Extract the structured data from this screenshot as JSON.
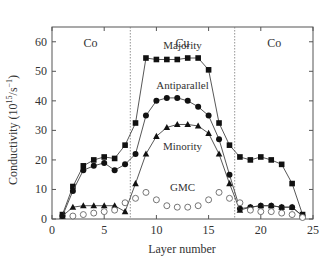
{
  "chart_data": {
    "type": "line",
    "title": "",
    "xlabel": "Layer number",
    "ylabel": "Conductivity (10^15 /s^-1)",
    "ylabel_parts": {
      "main": "Conductivity (10",
      "sup1": "15",
      "mid": "/s",
      "sup2": "−1",
      "end": ")"
    },
    "xlim": [
      0,
      25
    ],
    "ylim": [
      0,
      65
    ],
    "xticks": [
      0,
      5,
      10,
      15,
      20,
      25
    ],
    "yticks": [
      0,
      10,
      20,
      30,
      40,
      50,
      60
    ],
    "grid": false,
    "legend_position": "inline labels",
    "region_boundaries": [
      7.5,
      17.5
    ],
    "regions": [
      {
        "label": "Co",
        "x": 3.7
      },
      {
        "label": "Cu",
        "x": 12.5
      },
      {
        "label": "Co",
        "x": 21.3
      }
    ],
    "series": [
      {
        "name": "Majority",
        "marker": "filled-square",
        "line": true,
        "label_pos": [
          12.5,
          57.5
        ],
        "x": [
          1,
          2,
          3,
          4,
          5,
          6,
          7,
          8,
          9,
          10,
          11,
          12,
          13,
          14,
          15,
          16,
          17,
          18,
          19,
          20,
          21,
          22,
          23,
          24
        ],
        "values": [
          1.5,
          11,
          18,
          20,
          21,
          20.5,
          25,
          32.5,
          54.5,
          54,
          54,
          54,
          54.5,
          54.5,
          50.5,
          32.5,
          25,
          21,
          20,
          21,
          20,
          18.5,
          12,
          1.5
        ]
      },
      {
        "name": "Antiparallel",
        "marker": "filled-circle",
        "line": true,
        "label_pos": [
          12.5,
          44
        ],
        "x": [
          1,
          2,
          3,
          4,
          5,
          6,
          7,
          8,
          9,
          10,
          11,
          12,
          13,
          14,
          15,
          16,
          17,
          18,
          19,
          20,
          21,
          22,
          23,
          24
        ],
        "values": [
          1,
          9.5,
          16.5,
          18,
          19,
          16.5,
          18.5,
          22,
          35,
          40,
          41,
          41,
          40,
          38,
          35,
          27,
          15,
          3.5,
          4,
          4.5,
          4.5,
          4,
          4,
          1
        ]
      },
      {
        "name": "Minority",
        "marker": "filled-triangle",
        "line": true,
        "label_pos": [
          12.5,
          23.5
        ],
        "x": [
          1,
          2,
          3,
          4,
          5,
          6,
          7,
          8,
          9,
          10,
          11,
          12,
          13,
          14,
          15,
          16,
          17,
          18,
          19,
          20,
          21,
          22,
          23,
          24
        ],
        "values": [
          1,
          4,
          4.5,
          4.5,
          4.5,
          4.5,
          2.5,
          12,
          22,
          28,
          31,
          32,
          32,
          31.5,
          29,
          22,
          12,
          3,
          4,
          4.5,
          4.5,
          4,
          4,
          1
        ]
      },
      {
        "name": "GMC",
        "marker": "open-circle",
        "line": false,
        "label_pos": [
          12.5,
          9.5
        ],
        "x": [
          2,
          3,
          4,
          5,
          6,
          7,
          8,
          9,
          10,
          11,
          12,
          13,
          14,
          15,
          16,
          17,
          18,
          19,
          20,
          21,
          22,
          23,
          24
        ],
        "values": [
          1,
          1.5,
          2,
          2.5,
          3,
          5.5,
          7,
          9,
          6.5,
          4.5,
          4,
          4,
          4.5,
          6.5,
          9,
          7,
          5.5,
          3,
          2.5,
          2.5,
          2,
          1.5,
          0.5
        ]
      }
    ]
  }
}
